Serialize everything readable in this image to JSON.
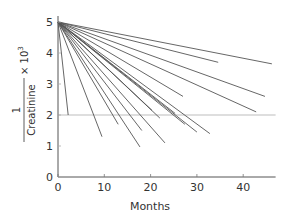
{
  "chart_data": {
    "type": "line",
    "title": "",
    "xlabel": "Months",
    "ylabel": "1 / Creatinine × 10³",
    "ylabel_parts": {
      "numerator": "1",
      "denominator": "Creatinine",
      "multiplier": "× 10",
      "exponent": "3"
    },
    "xlim": [
      0,
      47
    ],
    "ylim": [
      0,
      5
    ],
    "xticks": [
      0,
      10,
      20,
      30,
      40
    ],
    "yticks": [
      0,
      1,
      2,
      3,
      4,
      5
    ],
    "grid": false,
    "legend": null,
    "reference_line": {
      "y": 2,
      "x_range": [
        0,
        47
      ],
      "color": "#bdbdbd"
    },
    "line_color": "#555555",
    "series": [
      {
        "name": "patient-1",
        "x": [
          0,
          46.2
        ],
        "y": [
          5,
          3.65
        ]
      },
      {
        "name": "patient-2",
        "x": [
          0,
          34.6
        ],
        "y": [
          5,
          3.7
        ]
      },
      {
        "name": "patient-3",
        "x": [
          0,
          44.7
        ],
        "y": [
          5,
          2.6
        ]
      },
      {
        "name": "patient-4",
        "x": [
          0,
          42.8
        ],
        "y": [
          5,
          2.1
        ]
      },
      {
        "name": "patient-5",
        "x": [
          0,
          2.2
        ],
        "y": [
          5,
          2.0
        ]
      },
      {
        "name": "patient-6",
        "x": [
          0,
          9.5
        ],
        "y": [
          5,
          1.3
        ]
      },
      {
        "name": "patient-7",
        "x": [
          0,
          17.7
        ],
        "y": [
          5,
          0.97
        ]
      },
      {
        "name": "patient-8",
        "x": [
          0,
          13.0
        ],
        "y": [
          5,
          1.7
        ]
      },
      {
        "name": "patient-9",
        "x": [
          0,
          18.1
        ],
        "y": [
          5,
          1.5
        ]
      },
      {
        "name": "patient-10",
        "x": [
          0,
          23.1
        ],
        "y": [
          5,
          1.1
        ]
      },
      {
        "name": "patient-11",
        "x": [
          0,
          30.0
        ],
        "y": [
          5,
          1.45
        ]
      },
      {
        "name": "patient-12",
        "x": [
          0,
          32.8
        ],
        "y": [
          5,
          1.4
        ]
      },
      {
        "name": "patient-13",
        "x": [
          0,
          27.4
        ],
        "y": [
          5,
          1.7
        ]
      },
      {
        "name": "patient-14",
        "x": [
          0,
          22.0
        ],
        "y": [
          5,
          1.9
        ]
      },
      {
        "name": "patient-15",
        "x": [
          0,
          25.3
        ],
        "y": [
          5,
          2.05
        ]
      },
      {
        "name": "patient-16",
        "x": [
          0,
          20.3
        ],
        "y": [
          5,
          2.15
        ]
      },
      {
        "name": "patient-17",
        "x": [
          0,
          27.0
        ],
        "y": [
          5,
          2.6
        ]
      }
    ]
  }
}
